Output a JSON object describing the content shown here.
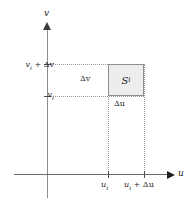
{
  "figure": {
    "name": "uv-plane-subrectangle-diagram",
    "background_color": "#ffffff"
  },
  "axes": {
    "vertical": {
      "label": "v",
      "icon": "arrow-up-icon",
      "color": "#8c8c8c"
    },
    "horizontal": {
      "label": "u",
      "icon": "arrow-right-icon",
      "color": "#6a6a6a"
    }
  },
  "ticks": {
    "vertical": [
      {
        "id": "vi",
        "label_plain": "v_i",
        "label_main": "v",
        "sub": "i",
        "suffix": ""
      },
      {
        "id": "vi_plus_dv",
        "label_plain": "v_i + Δv",
        "label_main": "v",
        "sub": "i",
        "suffix": " + Δv"
      }
    ],
    "horizontal": [
      {
        "id": "ui",
        "label_plain": "u_i",
        "label_main": "u",
        "sub": "i",
        "suffix": ""
      },
      {
        "id": "ui_plus_du",
        "label_plain": "u_i + Δu",
        "label_main": "u",
        "sub": "i",
        "suffix": " + Δu"
      }
    ]
  },
  "patch": {
    "name": "subrectangle",
    "label_main": "S",
    "label_sub": "i",
    "label_plain": "S_i",
    "fill_color": "#ededed",
    "border_color": "#8e8e8e"
  },
  "dimensions": {
    "height_label": "Δv",
    "width_label": "Δu"
  },
  "labels": {
    "v_axis": "v",
    "u_axis": "u",
    "y_tick_upper_main": "v",
    "y_tick_upper_sub": "i",
    "y_tick_upper_suffix": " + Δv",
    "y_tick_lower_main": "v",
    "y_tick_lower_sub": "i",
    "x_tick_left_main": "u",
    "x_tick_left_sub": "i",
    "x_tick_right_main": "u",
    "x_tick_right_sub": "i",
    "x_tick_right_suffix": " + Δu",
    "delta_v": "Δv",
    "delta_u": "Δu",
    "patch_main": "S",
    "patch_sub": "i"
  },
  "guides": {
    "style": "dotted",
    "color": "#9a9a9a",
    "count": 4
  }
}
